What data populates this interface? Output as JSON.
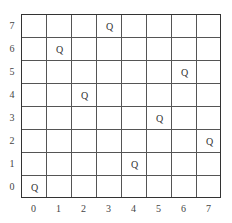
{
  "board": {
    "size": 8,
    "piece_symbol": "Q",
    "x_labels": [
      "0",
      "1",
      "2",
      "3",
      "4",
      "5",
      "6",
      "7"
    ],
    "y_labels": [
      "0",
      "1",
      "2",
      "3",
      "4",
      "5",
      "6",
      "7"
    ],
    "queens": [
      {
        "col": 0,
        "row": 0,
        "label": "Q"
      },
      {
        "col": 1,
        "row": 6,
        "label": "Q"
      },
      {
        "col": 2,
        "row": 4,
        "label": "Q"
      },
      {
        "col": 3,
        "row": 7,
        "label": "Q"
      },
      {
        "col": 4,
        "row": 1,
        "label": "Q"
      },
      {
        "col": 5,
        "row": 3,
        "label": "Q"
      },
      {
        "col": 6,
        "row": 5,
        "label": "Q"
      },
      {
        "col": 7,
        "row": 2,
        "label": "Q"
      }
    ],
    "colors": {
      "grid": "#555555",
      "border": "#333333",
      "text": "#333333",
      "background": "#ffffff"
    }
  }
}
